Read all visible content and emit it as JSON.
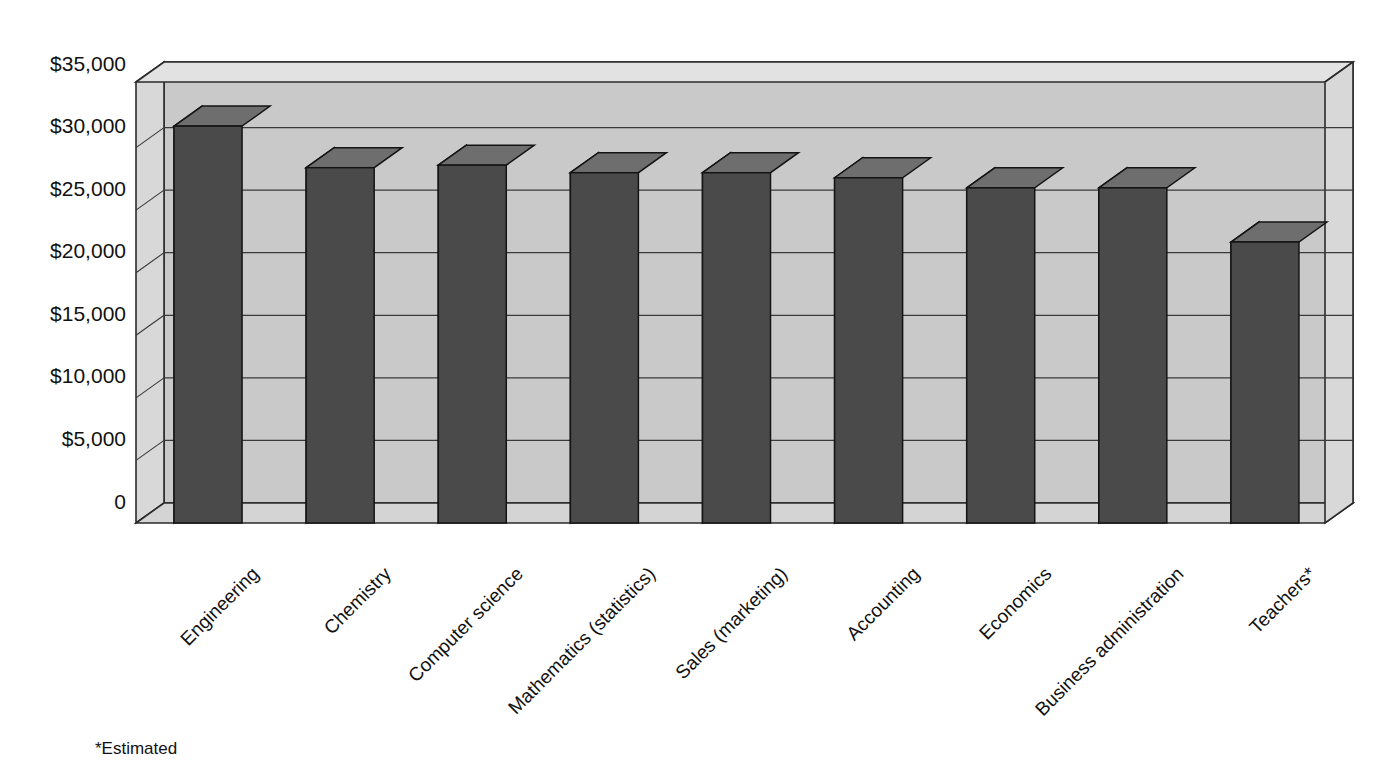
{
  "chart_data": {
    "type": "bar",
    "title": "",
    "subtitle": "",
    "xlabel": "",
    "ylabel": "",
    "categories": [
      "Engineering",
      "Chemistry",
      "Computer science",
      "Mathematics (statistics)",
      "Sales (marketing)",
      "Accounting",
      "Economics",
      "Business administration",
      "Teachers*"
    ],
    "values": [
      31500,
      28200,
      28400,
      27800,
      27800,
      27400,
      26600,
      26600,
      22300
    ],
    "ylim": [
      0,
      35000
    ],
    "ytick_values": [
      0,
      5000,
      10000,
      15000,
      20000,
      25000,
      30000,
      35000
    ],
    "ytick_labels": [
      "0",
      "$5,000",
      "$10,000",
      "$15,000",
      "$20,000",
      "$25,000",
      "$30,000",
      "$35,000"
    ],
    "grid": true,
    "legend": "none",
    "style_3d": true,
    "annotations": [
      "*Estimated"
    ]
  },
  "axis": {
    "y_labels": [
      "$35,000",
      "$30,000",
      "$25,000",
      "$20,000",
      "$15,000",
      "$10,000",
      "$5,000",
      "0"
    ],
    "x_labels": [
      "Engineering",
      "Chemistry",
      "Computer science",
      "Mathematics (statistics)",
      "Sales (marketing)",
      "Accounting",
      "Economics",
      "Business administration",
      "Teachers*"
    ]
  },
  "footnote": {
    "text": "*Estimated"
  },
  "colors": {
    "bar_front": "#4a4a4a",
    "bar_side": "#9d9d9d",
    "bar_top": "#6e6e6e",
    "wall_back": "#c9c9c9",
    "wall_left": "#d8d8d8",
    "floor": "#d4d4d4",
    "gridline": "#3a3a3a",
    "background": "#ffffff",
    "text": "#111111"
  }
}
